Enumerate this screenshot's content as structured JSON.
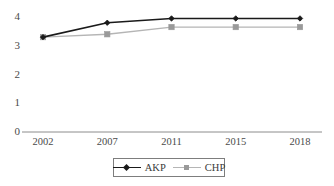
{
  "chart_data": {
    "type": "line",
    "title": "",
    "xlabel": "",
    "ylabel": "",
    "categories": [
      "2002",
      "2007",
      "2011",
      "2015",
      "2018"
    ],
    "x": [
      2002,
      2007,
      2011,
      2015,
      2018
    ],
    "series": [
      {
        "name": "AKP",
        "color": "#1a1a1a",
        "marker": "diamond",
        "values": [
          3.3,
          3.8,
          3.95,
          3.95,
          3.95
        ]
      },
      {
        "name": "CHP",
        "color": "#b5b5b5",
        "marker": "square",
        "marker_color": "#9a9a9a",
        "values": [
          3.3,
          3.4,
          3.65,
          3.65,
          3.65
        ]
      }
    ],
    "ylim": [
      0,
      4.35
    ],
    "yticks": [
      "0",
      "1",
      "2",
      "3",
      "4"
    ],
    "ytick_values": [
      0,
      1,
      2,
      3,
      4
    ],
    "grid": false,
    "legend_position": "bottom"
  },
  "legend": {
    "entries": [
      {
        "label": "AKP"
      },
      {
        "label": "CHP"
      }
    ]
  },
  "axes": {
    "x_axis_line_color": "#8c8c8c",
    "background": "#ffffff"
  }
}
